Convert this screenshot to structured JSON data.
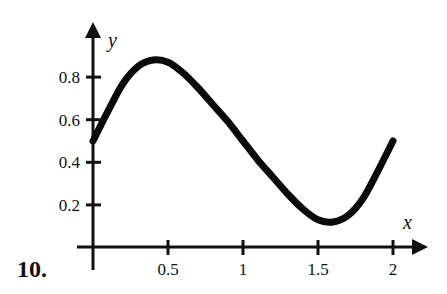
{
  "problem": {
    "number_label": "10."
  },
  "chart_data": {
    "type": "line",
    "title": "",
    "xlabel": "x",
    "ylabel": "y",
    "xlim": [
      0,
      2.2
    ],
    "ylim": [
      0,
      1.0
    ],
    "grid": false,
    "legend": null,
    "x_ticks": [
      0.5,
      1,
      1.5,
      2
    ],
    "x_tick_labels": [
      "0.5",
      "1",
      "1.5",
      "2"
    ],
    "y_ticks": [
      0.2,
      0.4,
      0.6,
      0.8
    ],
    "y_tick_labels": [
      "0.2",
      "0.4",
      "0.6",
      "0.8"
    ],
    "series": [
      {
        "name": "f(x)",
        "x": [
          0,
          0.1,
          0.2,
          0.3,
          0.4,
          0.5,
          0.6,
          0.7,
          0.8,
          0.9,
          1.0,
          1.1,
          1.2,
          1.3,
          1.4,
          1.5,
          1.6,
          1.7,
          1.8,
          1.9,
          2.0
        ],
        "values": [
          0.5,
          0.64,
          0.77,
          0.85,
          0.88,
          0.87,
          0.82,
          0.75,
          0.67,
          0.59,
          0.5,
          0.41,
          0.33,
          0.25,
          0.18,
          0.13,
          0.12,
          0.15,
          0.23,
          0.36,
          0.5
        ]
      }
    ],
    "annotations": [
      {
        "text": "peak ≈ (0.41, 0.88)"
      },
      {
        "text": "trough ≈ (1.56, 0.12)"
      }
    ]
  }
}
